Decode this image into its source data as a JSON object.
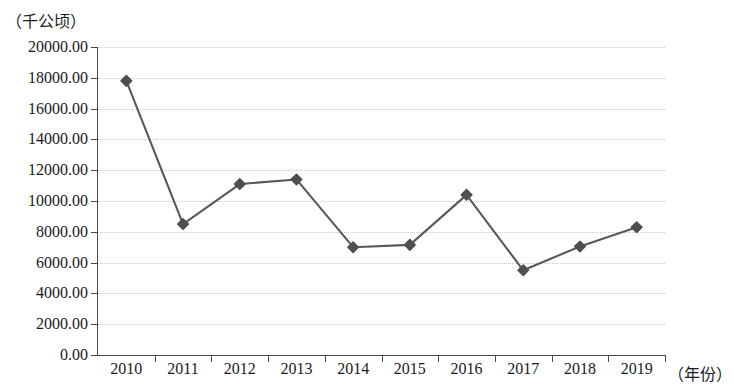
{
  "chart_data": {
    "type": "line",
    "title": "",
    "subtitle": "",
    "xlabel": "（年份）",
    "ylabel": "（千公顷）",
    "categories": [
      "2010",
      "2011",
      "2012",
      "2013",
      "2014",
      "2015",
      "2016",
      "2017",
      "2018",
      "2019"
    ],
    "values": [
      17800,
      8500,
      11100,
      11400,
      7000,
      7150,
      10400,
      5500,
      7050,
      8300
    ],
    "series": [
      {
        "name": "",
        "values": [
          17800,
          8500,
          11100,
          11400,
          7000,
          7150,
          10400,
          5500,
          7050,
          8300
        ]
      }
    ],
    "ylim": [
      0,
      20000
    ],
    "ytick_labels": [
      "20000.00",
      "18000.00",
      "16000.00",
      "14000.00",
      "12000.00",
      "10000.00",
      "8000.00",
      "6000.00",
      "4000.00",
      "2000.00",
      "0.00"
    ],
    "ytick_values": [
      20000,
      18000,
      16000,
      14000,
      12000,
      10000,
      8000,
      6000,
      4000,
      2000,
      0
    ],
    "grid": true,
    "grid_style": "dotted",
    "legend": false,
    "legend_position": "none",
    "marker": "diamond",
    "colors": {
      "line": "#595959",
      "marker": "#4f4f4f",
      "grid": "#c9c9c9",
      "axis": "#4a4a4a",
      "text": "#1a1a1a",
      "background": "#ffffff"
    }
  }
}
